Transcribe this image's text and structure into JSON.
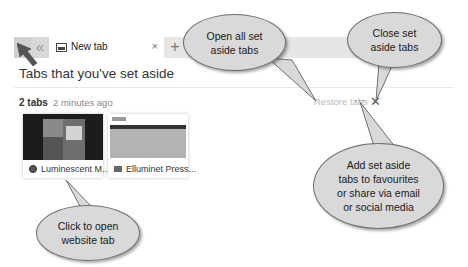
{
  "tabbar": {
    "active_tab_title": "New tab",
    "close_glyph": "×",
    "back_glyph": "«",
    "new_tab_glyph": "+"
  },
  "page": {
    "title": "Tabs that you've set aside"
  },
  "group": {
    "count_label": "2 tabs",
    "time_label": "2 minutes ago",
    "restore_label": "Restore tabs",
    "more_glyph": "···",
    "close_glyph": "✕",
    "tabs": [
      {
        "title": "Luminescent M..."
      },
      {
        "title": "Elluminet Press..."
      }
    ]
  },
  "callouts": {
    "open_all": [
      "Open all set",
      "aside tabs"
    ],
    "close": [
      "Close set",
      "aside tabs"
    ],
    "share": [
      "Add set aside",
      "tabs to favourites",
      "or share via email",
      "or social media"
    ],
    "click": [
      "Click to open",
      "website tab"
    ]
  },
  "colors": {
    "callout_fill": "#d9d9d9",
    "callout_border": "#6f6f6f",
    "tabbar_bg": "#e6e6e6"
  }
}
